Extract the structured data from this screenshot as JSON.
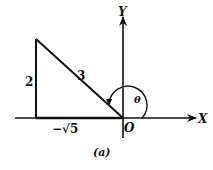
{
  "figure": {
    "caption": "(a)",
    "axes": {
      "x_label": "X",
      "y_label": "Y",
      "origin_label": "O"
    },
    "triangle": {
      "vertical_side_label": "2",
      "hypotenuse_label": "3",
      "horizontal_side_label": "−√5"
    },
    "angle_label": "θ",
    "colors": {
      "stroke": "#111111",
      "background": "#ffffff"
    }
  }
}
